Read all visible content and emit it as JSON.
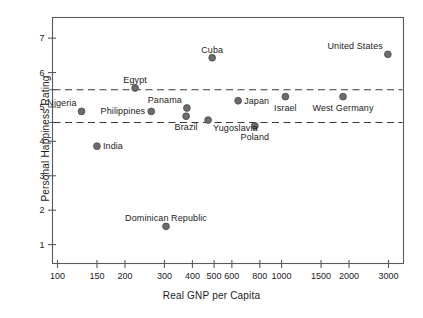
{
  "chart_data": {
    "type": "scatter",
    "title": "",
    "xlabel": "Real GNP per Capita",
    "ylabel": "Personal Happiness Rating",
    "x_scale": "log",
    "xlim": [
      95,
      3500
    ],
    "ylim": [
      0.45,
      7.6
    ],
    "grid": false,
    "legend": "none",
    "x_ticks": [
      100,
      150,
      200,
      300,
      400,
      500,
      600,
      800,
      1000,
      1500,
      2000,
      3000
    ],
    "x_tick_labels": [
      "100",
      "150",
      "200",
      "300",
      "400",
      "500",
      "600",
      "800",
      "1000",
      "1500",
      "2000",
      "3000"
    ],
    "y_ticks": [
      1,
      2,
      3,
      4,
      5,
      6,
      7
    ],
    "y_tick_labels": [
      "1",
      "2",
      "3",
      "4",
      "5",
      "6",
      "7"
    ],
    "reference_lines": [
      {
        "name": "upper-band",
        "y": 5.5,
        "style": "dashed"
      },
      {
        "name": "lower-band",
        "y": 4.55,
        "style": "dashed"
      }
    ],
    "marker_color": "#6b6b6b",
    "marker_edge_color": "#4a4a4a",
    "axis_color": "#5a5a5a",
    "points": [
      {
        "label": "Nigeria",
        "x": 128,
        "y": 4.87,
        "label_pos": "above-left"
      },
      {
        "label": "India",
        "x": 150,
        "y": 3.86,
        "label_pos": "right"
      },
      {
        "label": "Egypt",
        "x": 222,
        "y": 5.55,
        "label_pos": "above"
      },
      {
        "label": "Philippines",
        "x": 262,
        "y": 4.87,
        "label_pos": "left"
      },
      {
        "label": "Dominican Republic",
        "x": 305,
        "y": 1.53,
        "label_pos": "above"
      },
      {
        "label": "Brazil",
        "x": 375,
        "y": 4.73,
        "label_pos": "below"
      },
      {
        "label": "Panama",
        "x": 378,
        "y": 4.97,
        "label_pos": "above-left"
      },
      {
        "label": "Yugoslavia",
        "x": 470,
        "y": 4.62,
        "label_pos": "below-right"
      },
      {
        "label": "Cuba",
        "x": 490,
        "y": 6.43,
        "label_pos": "above"
      },
      {
        "label": "Japan",
        "x": 640,
        "y": 5.18,
        "label_pos": "right"
      },
      {
        "label": "Poland",
        "x": 760,
        "y": 4.45,
        "label_pos": "below"
      },
      {
        "label": "Israel",
        "x": 1040,
        "y": 5.3,
        "label_pos": "below"
      },
      {
        "label": "West Germany",
        "x": 1880,
        "y": 5.3,
        "label_pos": "below"
      },
      {
        "label": "United States",
        "x": 2980,
        "y": 6.53,
        "label_pos": "above-left"
      }
    ]
  }
}
